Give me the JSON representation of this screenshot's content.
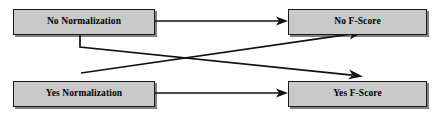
{
  "diagram": {
    "canvas": {
      "width": 439,
      "height": 115
    },
    "colors": {
      "box_fill": "#c9c9c9",
      "box_border": "#1a1a1a",
      "edge": "#111111",
      "text": "#000000",
      "background": "#ffffff"
    },
    "nodes": [
      {
        "id": "no-normalization",
        "label": "No Normalization",
        "x": 13,
        "y": 9,
        "width": 142,
        "height": 26
      },
      {
        "id": "no-f-score",
        "label": "No F-Score",
        "x": 288,
        "y": 9,
        "width": 139,
        "height": 26
      },
      {
        "id": "yes-normalization",
        "label": "Yes Normalization",
        "x": 13,
        "y": 81,
        "width": 142,
        "height": 26
      },
      {
        "id": "yes-f-score",
        "label": "Yes F-Score",
        "x": 288,
        "y": 81,
        "width": 139,
        "height": 26
      }
    ],
    "edges": [
      {
        "id": "edge-no-norm-to-no-fscore",
        "from": "no-normalization",
        "to": "no-f-score",
        "kind": "straight-horizontal",
        "points": "155,21 283,21"
      },
      {
        "id": "edge-yes-norm-to-yes-fscore",
        "from": "yes-normalization",
        "to": "yes-f-score",
        "kind": "straight-horizontal",
        "points": "155,93 283,93"
      },
      {
        "id": "edge-no-norm-to-yes-fscore",
        "from": "no-normalization",
        "to": "yes-f-score",
        "kind": "elbow-then-diagonal",
        "points": "80,35 80,47 357,76"
      },
      {
        "id": "edge-yes-norm-to-no-fscore",
        "from": "yes-normalization",
        "to": "no-f-score",
        "kind": "diagonal",
        "points": "81,73 357,33"
      }
    ]
  }
}
